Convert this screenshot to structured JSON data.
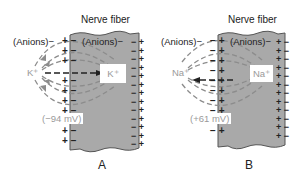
{
  "panels": [
    {
      "id": "A",
      "title": "Nerve fiber",
      "outside_label": "(Anions)",
      "outside_label_sign": "−",
      "inside_label": "(Anions)",
      "inside_label_sign": "−",
      "ion_outside": "K⁺",
      "ion_inside": "K⁺",
      "potential": "(−94 mV)",
      "panel_label": "A",
      "left_membrane": {
        "outside_charge": "+",
        "inside_charge": "−"
      },
      "right_membrane": {
        "inside_charge": "−",
        "outside_charge": "+"
      },
      "arrow_direction": "inward"
    },
    {
      "id": "B",
      "title": "Nerve fiber",
      "outside_label": "(Anions)",
      "outside_label_sign": "−",
      "inside_label": "(Anions)",
      "inside_label_sign": "−",
      "ion_outside": "Na⁺",
      "ion_inside": "Na⁺",
      "potential": "(+61 mV)",
      "panel_label": "B",
      "left_membrane": {
        "outside_charge": "−",
        "inside_charge": "+"
      },
      "right_membrane": {
        "inside_charge": "+",
        "outside_charge": "−"
      },
      "arrow_direction": "outward"
    }
  ],
  "colors": {
    "fiber_fill": "#a9a9a9",
    "fiber_border": "#555555",
    "dashed_lines": "#8c8c8c",
    "charge_text": "#222222",
    "ion_text": "#9a9a9a"
  }
}
